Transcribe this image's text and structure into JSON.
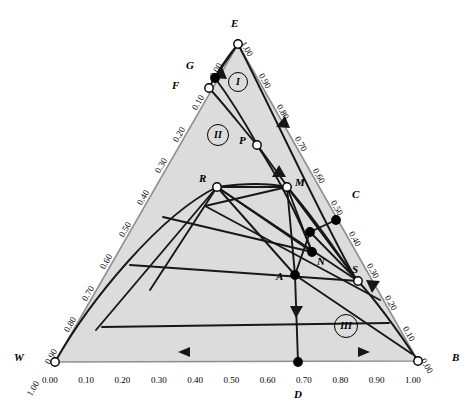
{
  "figure": {
    "type": "ternary-phase-diagram",
    "vertices": [
      {
        "name": "E",
        "label": "E",
        "x": 238,
        "y": 44,
        "marker": "open",
        "lx": 231,
        "ly": 22
      },
      {
        "name": "W",
        "label": "W",
        "x": 55,
        "y": 362,
        "marker": "open",
        "lx": 16,
        "ly": 353
      },
      {
        "name": "B",
        "label": "B",
        "x": 418,
        "y": 361,
        "marker": "open",
        "lx": 452,
        "ly": 352
      }
    ],
    "points": [
      {
        "name": "G",
        "label": "G",
        "x": 215,
        "y": 78,
        "marker": "filled",
        "lx": 186,
        "ly": 63
      },
      {
        "name": "F",
        "label": "F",
        "x": 209,
        "y": 88,
        "marker": "open",
        "lx": 173,
        "ly": 83
      },
      {
        "name": "P",
        "label": "P",
        "x": 257,
        "y": 145,
        "marker": "open",
        "lx": 240,
        "ly": 138
      },
      {
        "name": "R",
        "label": "R",
        "x": 217,
        "y": 187,
        "marker": "open",
        "lx": 200,
        "ly": 177
      },
      {
        "name": "M",
        "label": "M",
        "x": 287,
        "y": 187,
        "marker": "open",
        "lx": 294,
        "ly": 180
      },
      {
        "name": "C",
        "label": "C",
        "x": 336,
        "y": 220,
        "marker": "filled",
        "lx": 351,
        "ly": 193
      },
      {
        "name": "K",
        "label": "",
        "x": 310,
        "y": 232,
        "marker": "filled",
        "lx": 0,
        "ly": 0
      },
      {
        "name": "N",
        "label": "N",
        "x": 312,
        "y": 252,
        "marker": "filled",
        "lx": 317,
        "ly": 258
      },
      {
        "name": "A",
        "label": "A",
        "x": 295,
        "y": 275,
        "marker": "filled",
        "lx": 278,
        "ly": 273
      },
      {
        "name": "S",
        "label": "S",
        "x": 358,
        "y": 281,
        "marker": "open",
        "lx": 353,
        "ly": 268
      },
      {
        "name": "D",
        "label": "D",
        "x": 298,
        "y": 362,
        "marker": "filled",
        "lx": 293,
        "ly": 392
      }
    ],
    "regions": [
      {
        "name": "region-I",
        "label": "I",
        "x": 237,
        "y": 81
      },
      {
        "name": "region-II",
        "label": "II",
        "x": 217,
        "y": 133
      },
      {
        "name": "region-III",
        "label": "III",
        "x": 345,
        "y": 324
      }
    ],
    "axes": {
      "bottom": {
        "name": "bottom-axis",
        "labels": [
          "0.00",
          "0.10",
          "0.20",
          "0.30",
          "0.40",
          "0.50",
          "0.60",
          "0.70",
          "0.80",
          "0.90",
          "1.00"
        ],
        "arrows": [
          "left",
          "right"
        ]
      },
      "left": {
        "name": "left-axis",
        "labels": [
          "0.00",
          "0.10",
          "0.20",
          "0.30",
          "0.40",
          "0.50",
          "0.60",
          "0.70",
          "0.80",
          "0.90",
          "1.00"
        ]
      },
      "right": {
        "name": "right-axis",
        "labels": [
          "1.00",
          "0.90",
          "0.80",
          "0.70",
          "0.60",
          "0.50",
          "0.40",
          "0.30",
          "0.20",
          "0.10",
          "0.00"
        ],
        "arrows": [
          "up",
          "down"
        ]
      }
    },
    "colors": {
      "fill": "#dcdcdc",
      "line": "#1a1a1a",
      "edge": "#8c8c8c",
      "marker_fill_open": "#ffffff",
      "marker_fill_closed": "#000000"
    }
  },
  "chart_data": {
    "type": "scatter",
    "title": "",
    "xlabel": "",
    "ylabel": "",
    "axis_ranges": {
      "bottom": [
        0.0,
        1.0
      ],
      "left": [
        0.0,
        1.0
      ],
      "right": [
        0.0,
        1.0
      ]
    },
    "tick_step": 0.1,
    "grid": false,
    "legend": "none",
    "categories": [
      "E",
      "W",
      "B",
      "G",
      "F",
      "P",
      "R",
      "M",
      "C",
      "N",
      "A",
      "S",
      "D"
    ],
    "series": [
      {
        "name": "labelled-points",
        "values": [
          {
            "label": "E",
            "bottom": 0.5,
            "left": 0.0,
            "right": 1.0,
            "marker": "open"
          },
          {
            "label": "W",
            "bottom": 0.0,
            "left": 1.0,
            "right": 0.0,
            "marker": "open"
          },
          {
            "label": "B",
            "bottom": 1.0,
            "left": 0.0,
            "right": 0.0,
            "marker": "open"
          },
          {
            "label": "G",
            "bottom": 0.45,
            "left": 0.1,
            "right": 0.9,
            "marker": "filled"
          },
          {
            "label": "F",
            "bottom": 0.42,
            "left": 0.16,
            "right": 0.86,
            "marker": "open"
          },
          {
            "label": "P",
            "bottom": 0.55,
            "left": 0.32,
            "right": 0.68,
            "marker": "open"
          },
          {
            "label": "R",
            "bottom": 0.44,
            "left": 0.45,
            "right": 0.56,
            "marker": "open"
          },
          {
            "label": "M",
            "bottom": 0.64,
            "left": 0.36,
            "right": 0.55,
            "marker": "open"
          },
          {
            "label": "C",
            "bottom": 0.77,
            "left": 0.23,
            "right": 0.45,
            "marker": "filled"
          },
          {
            "label": "N",
            "bottom": 0.7,
            "left": 0.3,
            "right": 0.35,
            "marker": "filled"
          },
          {
            "label": "A",
            "bottom": 0.66,
            "left": 0.34,
            "right": 0.28,
            "marker": "filled"
          },
          {
            "label": "S",
            "bottom": 0.83,
            "left": 0.17,
            "right": 0.26,
            "marker": "open"
          },
          {
            "label": "D",
            "bottom": 0.7,
            "left": 0.3,
            "right": 0.0,
            "marker": "filled"
          }
        ]
      }
    ]
  }
}
